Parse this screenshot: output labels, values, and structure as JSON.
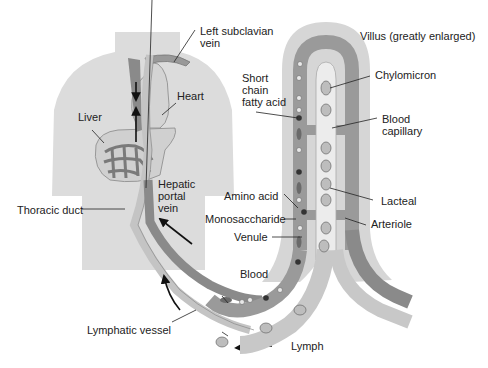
{
  "title": "Villus (greatly enlarged)",
  "labels": {
    "left_subclavian_vein": "Left subclavian\nvein",
    "heart": "Heart",
    "liver": "Liver",
    "hepatic_portal_vein": "Hepatic\nportal\nvein",
    "thoracic_duct": "Thoracic duct",
    "lymphatic_vessel": "Lymphatic vessel",
    "lymph": "Lymph",
    "blood": "Blood",
    "short_chain_fatty_acid": "Short\nchain\nfatty acid",
    "amino_acid": "Amino acid",
    "monosaccharide": "Monosaccharide",
    "venule": "Venule",
    "chylomicron": "Chylomicron",
    "blood_capillary": "Blood\ncapillary",
    "lacteal": "Lacteal",
    "arteriole": "Arteriole"
  },
  "colors": {
    "body_silhouette": "#dcdcdc",
    "villus_outer": "#d2d2d2",
    "villus_inner": "#ebebeb",
    "vessel_dark": "#8a8a8a",
    "vessel_mid": "#a8a8a8",
    "lymph_vessel": "#c4c4c4",
    "lacteal": "#e6e6e6",
    "text": "#222222"
  }
}
